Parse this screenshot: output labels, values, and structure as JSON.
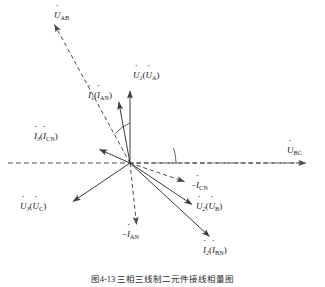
{
  "figure": {
    "type": "phasor-diagram",
    "caption": "图4-13  三相三线制二元件接线相量图",
    "origin": {
      "x": 130,
      "y": 163
    },
    "background_color": "#ffffff",
    "line_color": "#3c3c3c",
    "dash_color": "#4a4a4a",
    "text_color": "#1a1a1a"
  },
  "vectors": [
    {
      "id": "u1-ua",
      "name": "U1 (UA)",
      "symbol": "U",
      "index": "1",
      "paren_symbol": "U",
      "paren_sub": "A",
      "style": "solid",
      "tip": {
        "x": 130,
        "y": 88
      },
      "angle_deg": 90,
      "label_x": 132,
      "label_y": 72
    },
    {
      "id": "i1-ian",
      "name": "I1 (IAN)",
      "symbol": "I",
      "index": "1",
      "paren_symbol": "I",
      "paren_sub": "AN",
      "style": "solid",
      "tip": {
        "x": 118,
        "y": 99
      },
      "angle_deg": 100,
      "label_x": 90,
      "label_y": 92
    },
    {
      "id": "i3-icn",
      "name": "I3 (ICN)",
      "symbol": "I",
      "index": "3",
      "paren_symbol": "I",
      "paren_sub": "CN",
      "style": "solid",
      "tip": {
        "x": 96,
        "y": 148
      },
      "angle_deg": 157,
      "label_x": 36,
      "label_y": 133
    },
    {
      "id": "u3-uc",
      "name": "U3 (UC)",
      "symbol": "U",
      "index": "3",
      "paren_symbol": "U",
      "paren_sub": "C",
      "style": "solid",
      "tip": {
        "x": 70,
        "y": 204
      },
      "angle_deg": 214,
      "label_x": 22,
      "label_y": 203
    },
    {
      "id": "u2-ub",
      "name": "U2 (UB)",
      "symbol": "U",
      "index": "2",
      "paren_symbol": "U",
      "paren_sub": "B",
      "style": "solid",
      "tip": {
        "x": 195,
        "y": 207
      },
      "angle_deg": -33,
      "label_x": 197,
      "label_y": 203
    },
    {
      "id": "i2-ibn",
      "name": "I2 (IBN)",
      "symbol": "I",
      "index": "2",
      "paren_symbol": "I",
      "paren_sub": "BN",
      "style": "solid",
      "tip": {
        "x": 213,
        "y": 240
      },
      "angle_deg": -48,
      "label_x": 203,
      "label_y": 247
    }
  ],
  "dashed_vectors": [
    {
      "id": "uab",
      "name": "UAB",
      "symbol": "U",
      "sub": "AB",
      "tip": {
        "x": 52,
        "y": 22
      },
      "label_x": 54,
      "label_y": 12
    },
    {
      "id": "ubc",
      "name": "UBC",
      "symbol": "U",
      "sub": "BC",
      "tip": {
        "x": 310,
        "y": 163
      },
      "label_x": 288,
      "label_y": 147
    },
    {
      "id": "neg-icn",
      "name": "-ICN",
      "prefix": "−",
      "symbol": "I",
      "sub": "CN",
      "tip": {
        "x": 188,
        "y": 184
      },
      "label_x": 191,
      "label_y": 182
    },
    {
      "id": "neg-ian",
      "name": "-IAN",
      "prefix": "−",
      "symbol": "I",
      "sub": "AN",
      "tip": {
        "x": 137,
        "y": 228
      },
      "label_x": 124,
      "label_y": 231
    }
  ],
  "axis": {
    "horizontal_left_x": 8,
    "horizontal_right_x": 310,
    "y": 163
  },
  "arcs": [
    {
      "id": "arc-phi1",
      "label": "",
      "radius": 40,
      "start_deg": 90,
      "end_deg": 112
    },
    {
      "id": "arc-phi2",
      "label": "",
      "radius": 46,
      "start_deg": 0,
      "end_deg": -19
    }
  ]
}
